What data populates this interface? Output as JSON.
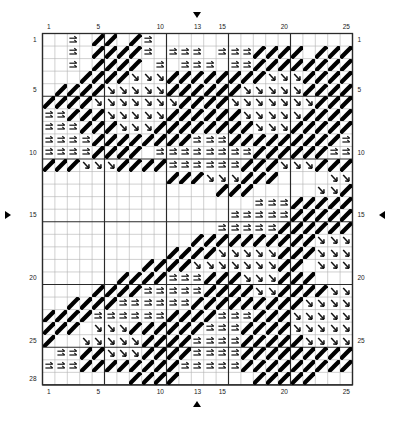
{
  "chart_data": {
    "type": "table",
    "title": "",
    "xlabel": "",
    "ylabel": "",
    "columns": 25,
    "rows": 28,
    "grid": true,
    "legend_position": "none",
    "col_labels_top": [
      "1",
      "5",
      "10",
      "13",
      "15",
      "20",
      "25"
    ],
    "col_labels_bottom": [
      "1",
      "5",
      "10",
      "13",
      "15",
      "20",
      "25"
    ],
    "row_labels_left": [
      "1",
      "5",
      "10",
      "15",
      "20",
      "25",
      "28"
    ],
    "row_labels_right": [
      "1",
      "5",
      "10",
      "15",
      "20",
      "25"
    ],
    "col_label_positions": [
      1,
      5,
      10,
      13,
      15,
      20,
      25
    ],
    "row_label_positions_left": [
      1,
      5,
      10,
      15,
      20,
      25,
      28
    ],
    "row_label_positions_right": [
      1,
      5,
      10,
      15,
      20,
      25
    ],
    "heavy_line_interval": 5,
    "symbol_legend": [
      {
        "key": "e",
        "name": "double-right-arrow-symbol",
        "glyph": "⇉"
      },
      {
        "key": "a",
        "name": "diagonal-down-right-arrow-symbol",
        "glyph": "↘"
      },
      {
        "key": "b",
        "name": "thick-diagonal-bar-symbol",
        "glyph": "╱"
      }
    ],
    "markers": [
      {
        "name": "top-center-marker",
        "direction": "down",
        "col": 13
      },
      {
        "name": "bottom-center-marker",
        "direction": "up",
        "col": 13
      },
      {
        "name": "left-center-marker",
        "direction": "right",
        "row": 15
      },
      {
        "name": "right-center-marker",
        "direction": "left",
        "row": 15
      }
    ],
    "cells": [
      "..e.bb.be................",
      "..e.bbbbe.eee.eeebbbb.bbb",
      "..e.bbbb.e.eee.eebbbbbbbb",
      "...bbbbaaabbbbbbbbaaabbbb",
      ".bbbbaaaaabbbbbbaaaaabbbb",
      "bbbbaaaaaaabbbbaaaaaaabbb",
      "eebbbaaaaabbbbbbaaaaabbbb",
      "eeebbbaaabbbbbbbbaaabbbbb",
      "eeeebbbbbbbbeeebbbbbbbbbe",
      "eeeebbbb.eeeeeeeebbbbbbee",
      "bbbaaabbbbeeeeeebbbaaabbb",
      "..........bbbaaabbb....aa",
      "..............bbb.....aab",
      ".................eeebbbbb",
      "...............eeeeebbbbb",
      "..............eeeeebbbbbb",
      "............bbbbbbbbbbaaa",
      "..........bbbbaaaaabbbaaa",
      "........bbbbaaaaaaabb.aaa",
      "......bbbbeeebbbaaabbb...",
      "....bbbbeeeeebbbbaabbbbaa",
      "..bbbbeeeeeebbbbbbbbbaaaa",
      "bbbbeeeeeebbbbeeebbbaaaaa",
      "bbb.aaabbbbbbeeebbbbaaaaa",
      "b..aaaaabbbbeeeebbbbbaaaa",
      ".eebbaaabbbbeeeebbbbbbbbb",
      "eeebbbbbbbbeeeeebbbbbbbbb",
      ".......bbbb......bbbbb..."
    ]
  }
}
